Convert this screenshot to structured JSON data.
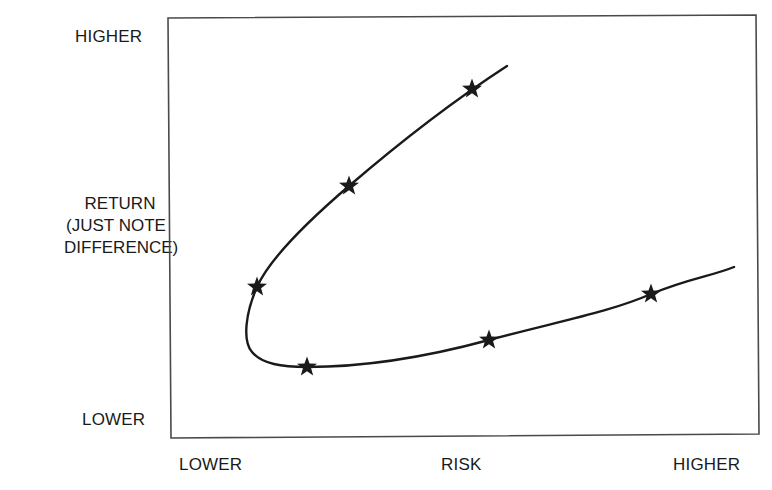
{
  "chart_data": {
    "type": "line",
    "title": "",
    "xlabel": "RISK",
    "ylabel": "RETURN (JUST NOTE DIFFERENCE)",
    "x_tick_labels": {
      "low": "LOWER",
      "high": "HIGHER"
    },
    "y_tick_labels": {
      "low": "LOWER",
      "high": "HIGHER"
    },
    "xlim": [
      0,
      10
    ],
    "ylim": [
      0,
      10
    ],
    "grid": false,
    "legend": null,
    "marker": "star",
    "series": [
      {
        "name": "efficient-frontier-curve",
        "description": "Parabola-shaped risk/return frontier opening to the right",
        "points": [
          {
            "x": 5.15,
            "y": 8.28
          },
          {
            "x": 3.06,
            "y": 5.97
          },
          {
            "x": 1.5,
            "y": 3.56
          },
          {
            "x": 2.35,
            "y": 1.65
          },
          {
            "x": 5.44,
            "y": 2.29
          },
          {
            "x": 8.2,
            "y": 3.39
          }
        ]
      }
    ]
  },
  "labels": {
    "y_high": "HIGHER",
    "y_title_line1": "RETURN",
    "y_title_line2": "(JUST NOTE",
    "y_title_line3": "DIFFERENCE)",
    "y_low": "LOWER",
    "x_low": "LOWER",
    "x_title": "RISK",
    "x_high": "HIGHER"
  },
  "colors": {
    "ink": "#1a1a1a",
    "frame": "#4a4a4a",
    "background": "#ffffff"
  },
  "stars_px": [
    {
      "cx": 472,
      "cy": 89
    },
    {
      "cx": 349,
      "cy": 186
    },
    {
      "cx": 257,
      "cy": 287
    },
    {
      "cx": 307,
      "cy": 367
    },
    {
      "cx": 489,
      "cy": 340
    },
    {
      "cx": 651,
      "cy": 294
    }
  ]
}
